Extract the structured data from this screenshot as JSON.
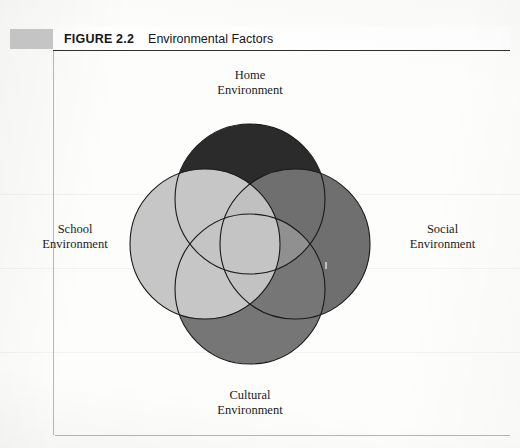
{
  "figure": {
    "number_label": "FIGURE 2.2",
    "title": "Environmental Factors"
  },
  "chart_data": {
    "type": "diagram",
    "subtype": "four-set-venn",
    "title": "Environmental Factors",
    "figure_number": "2.2",
    "sets": [
      {
        "id": "home",
        "label": "Home\nEnvironment",
        "label_line1": "Home",
        "label_line2": "Environment",
        "position": "top",
        "fill": "#2b2b2b",
        "stroke": "#1a1a1a",
        "cx": 140,
        "cy": 95,
        "r": 75,
        "z": 1
      },
      {
        "id": "school",
        "label": "School\nEnvironment",
        "label_line1": "School",
        "label_line2": "Environment",
        "position": "left",
        "fill": "#c6c6c6",
        "stroke": "#1a1a1a",
        "cx": 95,
        "cy": 140,
        "r": 75,
        "z": 2
      },
      {
        "id": "social",
        "label": "Social\nEnvironment",
        "label_line1": "Social",
        "label_line2": "Environment",
        "position": "right",
        "fill": "#6f6f6f",
        "stroke": "#1a1a1a",
        "cx": 185,
        "cy": 140,
        "r": 75,
        "z": 3
      },
      {
        "id": "cultural",
        "label": "Cultural\nEnvironment",
        "label_line1": "Cultural",
        "label_line2": "Environment",
        "position": "bottom",
        "fill": "#767676",
        "stroke": "#1a1a1a",
        "cx": 140,
        "cy": 185,
        "r": 75,
        "z": 4
      }
    ],
    "legend": "none"
  },
  "colors": {
    "home_fill": "#2b2b2b",
    "school_fill": "#c6c6c6",
    "social_fill": "#6f6f6f",
    "cultural_fill": "#767676",
    "outline": "#1a1a1a",
    "tab_gray": "#c9c9c9",
    "rule_dark": "#2f2f2f",
    "rule_light": "#b9b9b9",
    "page_background": "#fdfdfc",
    "text": "#1b1b1b"
  }
}
